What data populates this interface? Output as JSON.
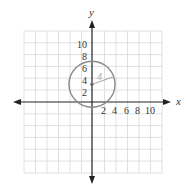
{
  "diagram": {
    "axes": {
      "x_label": "x",
      "y_label": "y"
    },
    "x_ticks": [
      "2",
      "4",
      "6",
      "8",
      "10"
    ],
    "y_ticks": [
      "2",
      "4",
      "6",
      "8",
      "10"
    ],
    "circle": {
      "center": [
        0,
        3
      ],
      "radius": 4,
      "radius_label": "4"
    },
    "grid": {
      "unit_per_cell": 2,
      "x_range": [
        -12,
        12
      ],
      "y_range": [
        -12,
        12
      ]
    },
    "colors": {
      "grid": "#d8d8d8",
      "axis": "#222222",
      "circle": "#8a8a8a",
      "radius_label": "#aaaaaa"
    }
  }
}
